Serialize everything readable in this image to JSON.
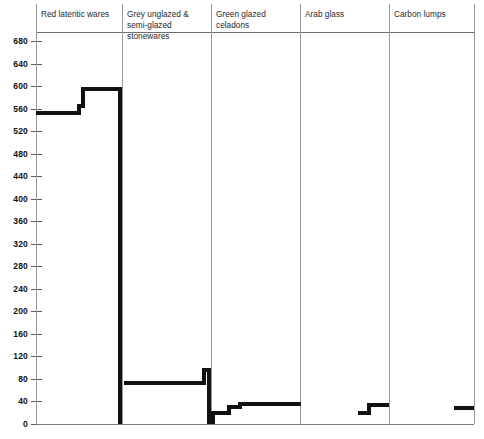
{
  "chart_data": {
    "type": "bar",
    "title": "",
    "xlabel": "",
    "ylabel": "",
    "ylim": [
      0,
      700
    ],
    "grid": false,
    "legend": "none",
    "y_ticks": [
      0,
      40,
      80,
      120,
      160,
      200,
      240,
      280,
      320,
      360,
      400,
      440,
      480,
      520,
      560,
      600,
      640,
      680
    ],
    "categories": [
      "Red lateritic wares",
      "Grey unglazed & semi-glazed stonewares",
      "Green glazed celadons",
      "Arab glass",
      "Carbon lumps"
    ],
    "series": [
      {
        "name": "Red lateritic wares",
        "steps": [
          {
            "value": 553,
            "span": 0.5
          },
          {
            "value": 565,
            "span": 0.05
          },
          {
            "value": 595,
            "span": 0.45
          }
        ]
      },
      {
        "name": "Grey unglazed & semi-glazed stonewares",
        "steps": [
          {
            "value": 0,
            "span": 0.02
          },
          {
            "value": 73,
            "span": 0.9
          },
          {
            "value": 96,
            "span": 0.08
          }
        ]
      },
      {
        "name": "Green glazed celadons",
        "steps": [
          {
            "value": 20,
            "span": 0.2
          },
          {
            "value": 30,
            "span": 0.12
          },
          {
            "value": 36,
            "span": 0.68
          }
        ]
      },
      {
        "name": "Arab glass",
        "steps": [
          {
            "value": 0,
            "span": 0.65
          },
          {
            "value": 20,
            "span": 0.12
          },
          {
            "value": 34,
            "span": 0.23
          }
        ]
      },
      {
        "name": "Carbon lumps",
        "steps": [
          {
            "value": 0,
            "span": 0.77
          },
          {
            "value": 28,
            "span": 0.23
          }
        ]
      }
    ]
  },
  "axis": {
    "ticks": [
      {
        "label": "680"
      },
      {
        "label": "640"
      },
      {
        "label": "600"
      },
      {
        "label": "560"
      },
      {
        "label": "520"
      },
      {
        "label": "480"
      },
      {
        "label": "440"
      },
      {
        "label": "400"
      },
      {
        "label": "360"
      },
      {
        "label": "320"
      },
      {
        "label": "280"
      },
      {
        "label": "240"
      },
      {
        "label": "200"
      },
      {
        "label": "160"
      },
      {
        "label": "120"
      },
      {
        "label": "80"
      },
      {
        "label": "40"
      },
      {
        "label": "0"
      }
    ]
  },
  "groups": [
    {
      "title": "Red lateritic wares"
    },
    {
      "title": "Grey unglazed & semi-glazed stonewares"
    },
    {
      "title": "Green glazed celadons"
    },
    {
      "title": "Arab glass"
    },
    {
      "title": "Carbon lumps"
    }
  ],
  "colors": {
    "series": "#111111",
    "axis": "#5a5a5a",
    "divider": "#8a8a8a",
    "background": "#ffffff"
  }
}
